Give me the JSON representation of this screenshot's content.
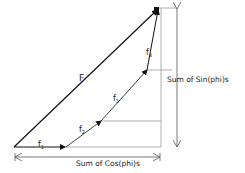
{
  "diagram": {
    "title": "",
    "labels": {
      "resultant": "F",
      "f1": "f",
      "f1_sub": "1",
      "f2": "f",
      "f2_sub": "2",
      "f3": "f",
      "f3_sub": "3",
      "f4": "f",
      "f4_sub": "4",
      "sum_sin": "Sum of Sin(phi)s",
      "sum_cos": "Sum of Cos(phi)s"
    },
    "points": {
      "origin": [
        14,
        147
      ],
      "f1_end": [
        65,
        147
      ],
      "f2_end": [
        101,
        121
      ],
      "f3_end": [
        147,
        70
      ],
      "f4_end": [
        158,
        10
      ]
    },
    "colors": {
      "vector": "#111111",
      "guide": "#888888",
      "dimension": "#555555"
    }
  }
}
